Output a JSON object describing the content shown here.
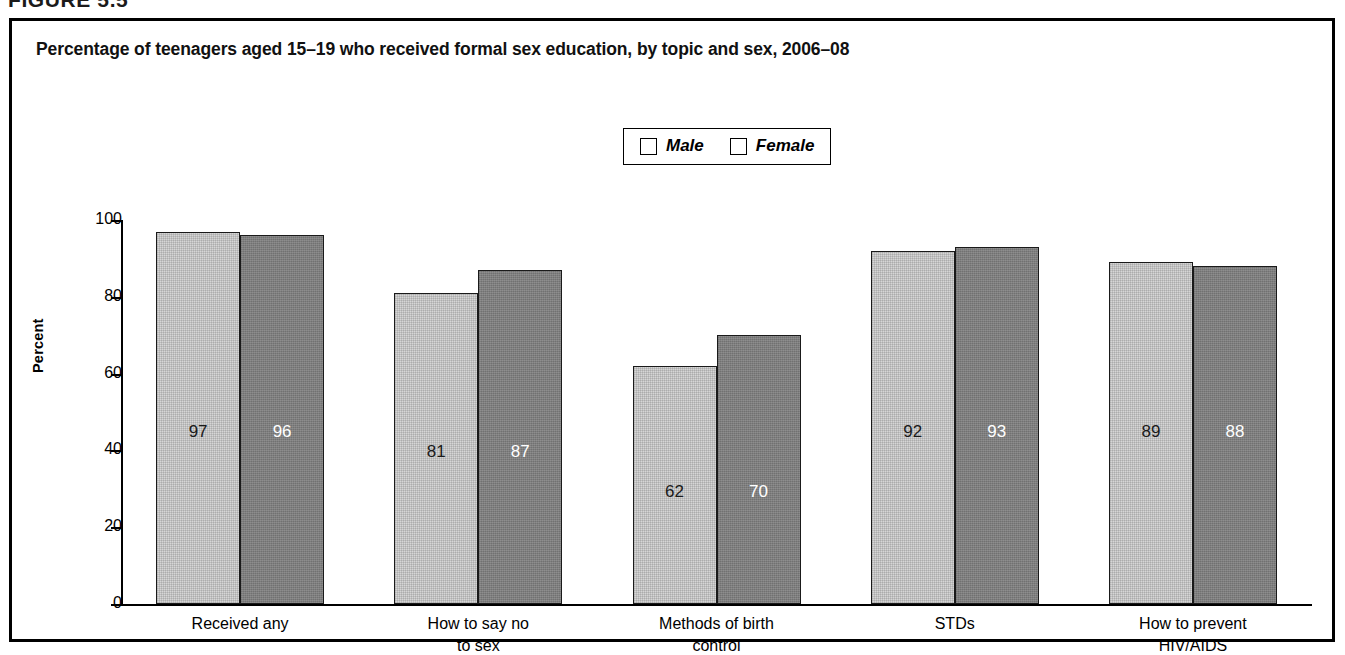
{
  "figure": {
    "label": "FIGURE 5.5"
  },
  "chart_data": {
    "type": "bar",
    "title": "Percentage of teenagers aged 15–19 who received formal sex education, by topic and sex, 2006–08",
    "xlabel": "",
    "ylabel": "Percent",
    "ylim": [
      0,
      100
    ],
    "ytick_labels": [
      "100",
      "80",
      "60",
      "40",
      "20",
      "0"
    ],
    "yticks": [
      100,
      80,
      60,
      40,
      20,
      0
    ],
    "grid": false,
    "legend_position": "top-center",
    "categories": [
      "Received any",
      "How to say no\nto sex",
      "Methods of birth\ncontrol",
      "STDs",
      "How to prevent\nHIV/AIDS"
    ],
    "series": [
      {
        "name": "Male",
        "color": "#d6d6d6",
        "values": [
          97,
          81,
          62,
          92,
          89
        ]
      },
      {
        "name": "Female",
        "color": "#7e7e7e",
        "values": [
          96,
          87,
          70,
          93,
          88
        ]
      }
    ]
  }
}
